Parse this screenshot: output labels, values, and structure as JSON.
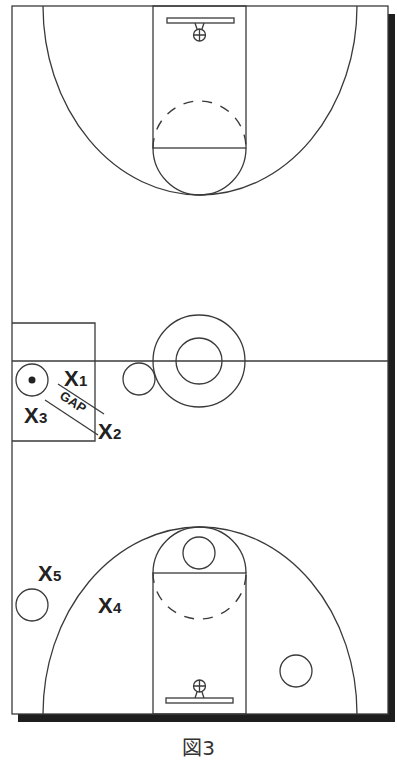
{
  "figure": {
    "caption": "図3",
    "type": "basketball-half-court-defense-diagram"
  },
  "players": {
    "defenders": [
      {
        "id": "x1",
        "letter": "X",
        "number": "1"
      },
      {
        "id": "x2",
        "letter": "X",
        "number": "2"
      },
      {
        "id": "x3",
        "letter": "X",
        "number": "3"
      },
      {
        "id": "x4",
        "letter": "X",
        "number": "4"
      },
      {
        "id": "x5",
        "letter": "X",
        "number": "5"
      }
    ],
    "offense": [
      {
        "id": "ball-handler",
        "has_ball": true
      },
      {
        "id": "wing-player",
        "has_ball": false
      },
      {
        "id": "high-post-player",
        "has_ball": false
      },
      {
        "id": "corner-player-left",
        "has_ball": false
      },
      {
        "id": "corner-player-right",
        "has_ball": false
      }
    ]
  },
  "annotations": {
    "gap_label": "GAP"
  },
  "colors": {
    "line": "#3a3a3a",
    "shadow": "#1e1e1e",
    "background": "#ffffff"
  }
}
